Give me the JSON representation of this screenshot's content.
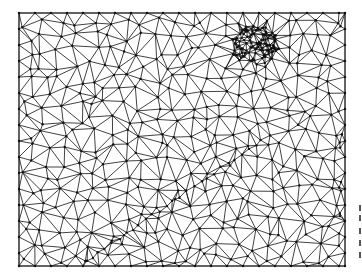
{
  "figure": {
    "kind": "triangulated mesh",
    "frame": {
      "x": 19,
      "y": 13,
      "width": 326,
      "height": 253
    },
    "colors": {
      "background": "#ffffff",
      "edges": "#111111",
      "nodes": "#111111",
      "frame": "#333333"
    },
    "mesh": {
      "seed": 7,
      "base_spacing": 16,
      "dense_cluster": {
        "cx": 255,
        "cy": 45,
        "radius": 22,
        "points": 140
      },
      "crease": {
        "x1": 85,
        "y1": 262,
        "x2": 262,
        "y2": 140,
        "points": 26
      },
      "right_edge_strip": {
        "x": 342,
        "points": 10
      }
    },
    "cropped_margin_marks": [
      205,
      215,
      228,
      240,
      252
    ]
  }
}
